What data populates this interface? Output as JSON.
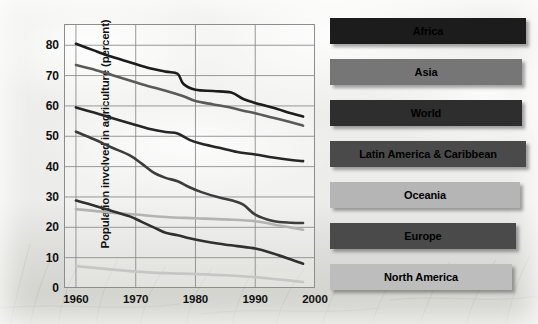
{
  "chart_data": {
    "type": "line",
    "title": "",
    "xlabel": "",
    "ylabel": "Population involved in agriculture (percent)",
    "xlim": [
      1958,
      2000
    ],
    "ylim": [
      0,
      87
    ],
    "x_ticks": [
      1960,
      1970,
      1980,
      1990,
      2000
    ],
    "y_ticks": [
      0,
      10,
      20,
      30,
      40,
      50,
      60,
      70,
      80
    ],
    "grid": true,
    "legend_position": "right",
    "series": [
      {
        "name": "Africa",
        "color": "#1c1c1c",
        "x": [
          1960,
          1963,
          1966,
          1969,
          1972,
          1975,
          1977,
          1978,
          1980,
          1983,
          1986,
          1988,
          1990,
          1993,
          1996,
          1998
        ],
        "values": [
          80.5,
          78.3,
          76.2,
          74.4,
          72.6,
          71.3,
          70.6,
          67.2,
          65.3,
          64.9,
          64.4,
          62.3,
          61.0,
          59.4,
          57.6,
          56.5
        ]
      },
      {
        "name": "Asia",
        "color": "#5a5a5a",
        "x": [
          1960,
          1963,
          1966,
          1969,
          1972,
          1975,
          1978,
          1980,
          1983,
          1986,
          1988,
          1990,
          1993,
          1996,
          1998
        ],
        "values": [
          73.5,
          72.0,
          70.2,
          68.4,
          66.6,
          65.0,
          63.2,
          61.6,
          60.5,
          59.4,
          58.4,
          57.6,
          56.1,
          54.6,
          53.5
        ]
      },
      {
        "name": "World",
        "color": "#262626",
        "x": [
          1960,
          1963,
          1966,
          1969,
          1972,
          1975,
          1977,
          1979,
          1981,
          1984,
          1987,
          1990,
          1993,
          1996,
          1998
        ],
        "values": [
          59.5,
          57.8,
          56.0,
          54.3,
          52.6,
          51.4,
          50.9,
          48.8,
          47.5,
          46.2,
          44.8,
          44.0,
          43.0,
          42.2,
          41.8
        ]
      },
      {
        "name": "Latin America & Caribbean",
        "color": "#3d3d3d",
        "x": [
          1960,
          1963,
          1966,
          1969,
          1971,
          1973,
          1975,
          1977,
          1979,
          1981,
          1984,
          1986,
          1988,
          1990,
          1993,
          1996,
          1998
        ],
        "values": [
          51.5,
          49.0,
          46.3,
          43.7,
          41.0,
          38.0,
          36.3,
          35.2,
          33.2,
          31.6,
          29.8,
          28.9,
          27.5,
          24.2,
          22.1,
          21.5,
          21.4
        ]
      },
      {
        "name": "Oceania",
        "color": "#b3b3b3",
        "x": [
          1960,
          1965,
          1970,
          1975,
          1980,
          1985,
          1990,
          1994,
          1998
        ],
        "values": [
          26.0,
          25.0,
          24.2,
          23.4,
          23.0,
          22.6,
          22.0,
          20.6,
          19.2
        ]
      },
      {
        "name": "Europe",
        "color": "#303030",
        "x": [
          1960,
          1963,
          1966,
          1969,
          1971,
          1973,
          1975,
          1977,
          1979,
          1981,
          1984,
          1987,
          1990,
          1993,
          1996,
          1998
        ],
        "values": [
          28.8,
          27.2,
          25.4,
          23.6,
          21.8,
          20.0,
          18.2,
          17.4,
          16.4,
          15.6,
          14.6,
          13.8,
          13.0,
          11.4,
          9.4,
          8.0
        ]
      },
      {
        "name": "North America",
        "color": "#c6c6c6",
        "x": [
          1960,
          1965,
          1970,
          1975,
          1980,
          1985,
          1990,
          1994,
          1998
        ],
        "values": [
          7.2,
          6.3,
          5.4,
          4.9,
          4.6,
          4.2,
          3.6,
          2.8,
          2.0
        ]
      }
    ]
  },
  "legend": {
    "items": [
      {
        "label": "Africa",
        "color": "#1c1c1c",
        "width": 196
      },
      {
        "label": "Asia",
        "color": "#767676",
        "width": 192
      },
      {
        "label": "World",
        "color": "#2e2e2e",
        "width": 192
      },
      {
        "label": "Latin America & Caribbean",
        "color": "#4a4a4a",
        "width": 196
      },
      {
        "label": "Oceania",
        "color": "#b5b5b5",
        "width": 190
      },
      {
        "label": "Europe",
        "color": "#4a4a4a",
        "width": 186
      },
      {
        "label": "North America",
        "color": "#bdbdbd",
        "width": 182
      }
    ]
  },
  "axes": {
    "y_label": "Population involved in agriculture (percent)",
    "y_ticks": [
      "80",
      "70",
      "60",
      "50",
      "40",
      "30",
      "20",
      "10",
      "0"
    ],
    "x_ticks": [
      "1960",
      "1970",
      "1980",
      "1990",
      "2000"
    ]
  }
}
